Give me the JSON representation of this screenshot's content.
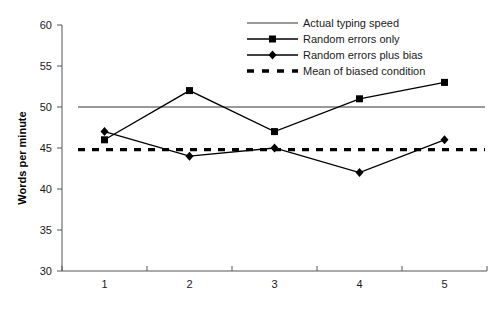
{
  "chart_data": {
    "type": "line",
    "title": "",
    "xlabel": "",
    "ylabel": "Words per minute",
    "categories": [
      "1",
      "2",
      "3",
      "4",
      "5"
    ],
    "ylim": [
      30,
      60
    ],
    "yticks": [
      30,
      35,
      40,
      45,
      50,
      55,
      60
    ],
    "ytick_labels": [
      "30",
      "35",
      "40",
      "45",
      "50",
      "55",
      "60"
    ],
    "xtick_labels": [
      "1",
      "2",
      "3",
      "4",
      "5"
    ],
    "grid": false,
    "legend_position": "top-right",
    "series": [
      {
        "name": "Actual typing speed",
        "style": "reference-line",
        "marker": "none",
        "color": "#999999",
        "constant_value": 50,
        "values": [
          50,
          50,
          50,
          50,
          50
        ]
      },
      {
        "name": "Random errors only",
        "style": "solid",
        "marker": "square",
        "color": "#000000",
        "values": [
          46,
          52,
          47,
          51,
          53
        ]
      },
      {
        "name": "Random errors plus bias",
        "style": "solid",
        "marker": "diamond",
        "color": "#000000",
        "values": [
          47,
          44,
          45,
          42,
          46
        ]
      },
      {
        "name": "Mean of biased condition",
        "style": "dashed",
        "marker": "none",
        "color": "#000000",
        "constant_value": 44.8,
        "values": [
          44.8,
          44.8,
          44.8,
          44.8,
          44.8
        ]
      }
    ]
  },
  "legend": {
    "items": [
      {
        "label": "Actual typing speed",
        "swatch": "gray-solid-line"
      },
      {
        "label": "Random errors only",
        "swatch": "black-line-square-marker"
      },
      {
        "label": "Random errors plus bias",
        "swatch": "black-line-diamond-marker"
      },
      {
        "label": "Mean of biased condition",
        "swatch": "black-dashed-line"
      }
    ]
  },
  "axes": {
    "y_title": "Words per minute"
  }
}
